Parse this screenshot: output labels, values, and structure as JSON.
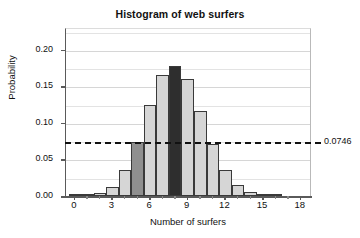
{
  "chart_data": {
    "type": "bar",
    "title": "Histogram of web surfers",
    "xlabel": "Number of surfers",
    "ylabel": "Probability",
    "categories": [
      0,
      1,
      2,
      3,
      4,
      5,
      6,
      7,
      8,
      9,
      10,
      11,
      12,
      13,
      14,
      15,
      16
    ],
    "values": [
      0.0002,
      0.0014,
      0.0039,
      0.0123,
      0.0353,
      0.0733,
      0.1251,
      0.1656,
      0.1783,
      0.1601,
      0.1169,
      0.0713,
      0.0355,
      0.0144,
      0.005,
      0.0016,
      0.0005
    ],
    "bar_colors": [
      "#d6d6d6",
      "#d6d6d6",
      "#d6d6d6",
      "#d6d6d6",
      "#d6d6d6",
      "#8f8f8f",
      "#d6d6d6",
      "#d6d6d6",
      "#2e2e2e",
      "#d6d6d6",
      "#d6d6d6",
      "#d6d6d6",
      "#d6d6d6",
      "#d6d6d6",
      "#d6d6d6",
      "#d6d6d6",
      "#d6d6d6"
    ],
    "xticks": [
      0,
      3,
      6,
      9,
      12,
      15,
      18
    ],
    "xtick_labels": [
      "0",
      "3",
      "6",
      "9",
      "12",
      "15",
      "18"
    ],
    "yticks": [
      0.0,
      0.05,
      0.1,
      0.15,
      0.2
    ],
    "ytick_labels": [
      "0.00",
      "0.05",
      "0.10",
      "0.15",
      "0.20"
    ],
    "xlim": [
      -0.7,
      18.9
    ],
    "ylim": [
      0,
      0.23
    ],
    "grid": true,
    "grid_interval": 0.025,
    "legend": null,
    "annotations": [
      {
        "type": "hline",
        "label": "0.0746",
        "value": 0.0746,
        "style": "dashed",
        "color": "#111111"
      }
    ],
    "colors": {
      "bar_light": "#d6d6d6",
      "bar_medium": "#8f8f8f",
      "bar_dark": "#2e2e2e",
      "bar_edge": "#3a3a3a",
      "axis": "#5a5a5a",
      "grid": "#e3e3e3",
      "text": "#111111"
    }
  }
}
